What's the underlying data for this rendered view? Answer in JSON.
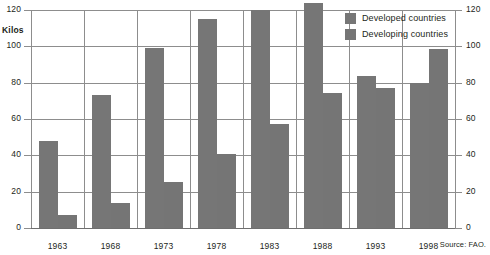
{
  "chart_data": {
    "type": "bar",
    "title": "",
    "xlabel": "",
    "ylabel": "Kilos",
    "ylim": [
      0,
      120
    ],
    "yticks": [
      0,
      20,
      40,
      60,
      80,
      100,
      120
    ],
    "ytick_labels": [
      "0",
      "20",
      "40",
      "60",
      "80",
      "100",
      "120"
    ],
    "grid": true,
    "dual_axis": true,
    "legend_position": "top-right",
    "categories": [
      "1963",
      "1968",
      "1973",
      "1978",
      "1983",
      "1988",
      "1993",
      "1998"
    ],
    "series": [
      {
        "name": "Developed countries",
        "color": "#767676",
        "values": [
          48,
          73,
          99,
          115,
          120,
          124,
          83.5,
          80
        ]
      },
      {
        "name": "Developing countries",
        "color": "#757575",
        "values": [
          7,
          14,
          25.5,
          41,
          57,
          74.5,
          77,
          98.5
        ]
      }
    ],
    "source": "Source: FAO."
  },
  "axis": {
    "unit_label": "Kilos"
  },
  "legend": {
    "items": [
      {
        "label": "Developed countries"
      },
      {
        "label": "Developing countries"
      }
    ]
  },
  "footer": {
    "source": "Source: FAO."
  }
}
